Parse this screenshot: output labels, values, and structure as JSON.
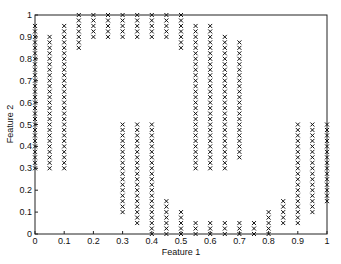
{
  "chart_data": {
    "type": "scatter",
    "title": "",
    "xlabel": "Feature 1",
    "ylabel": "Feature 2",
    "xlim": [
      0,
      1
    ],
    "ylim": [
      0,
      1
    ],
    "grid": false,
    "marker": "x",
    "xticks": [
      "0",
      "0.1",
      "0.2",
      "0.3",
      "0.4",
      "0.5",
      "0.6",
      "0.7",
      "0.8",
      "0.9",
      "1"
    ],
    "yticks": [
      "0",
      "0.1",
      "0.2",
      "0.3",
      "0.4",
      "0.5",
      "0.6",
      "0.7",
      "0.8",
      "0.9",
      "1"
    ],
    "columns": [
      {
        "x": 0.0,
        "ranges": [
          [
            0.3,
            0.95
          ]
        ]
      },
      {
        "x": 0.05,
        "ranges": [
          [
            0.3,
            0.9
          ]
        ]
      },
      {
        "x": 0.1,
        "ranges": [
          [
            0.3,
            0.95
          ]
        ]
      },
      {
        "x": 0.15,
        "ranges": [
          [
            0.85,
            1.0
          ]
        ]
      },
      {
        "x": 0.2,
        "ranges": [
          [
            0.9,
            1.0
          ]
        ]
      },
      {
        "x": 0.25,
        "ranges": [
          [
            0.9,
            1.0
          ]
        ]
      },
      {
        "x": 0.3,
        "ranges": [
          [
            0.1,
            0.5
          ],
          [
            0.9,
            1.0
          ]
        ]
      },
      {
        "x": 0.35,
        "ranges": [
          [
            0.05,
            0.5
          ],
          [
            0.9,
            1.0
          ]
        ]
      },
      {
        "x": 0.4,
        "ranges": [
          [
            0.0,
            0.5
          ],
          [
            0.9,
            1.0
          ]
        ]
      },
      {
        "x": 0.45,
        "ranges": [
          [
            0.0,
            0.15
          ],
          [
            0.9,
            1.0
          ]
        ]
      },
      {
        "x": 0.5,
        "ranges": [
          [
            0.0,
            0.1
          ],
          [
            0.85,
            1.0
          ]
        ]
      },
      {
        "x": 0.55,
        "ranges": [
          [
            0.0,
            0.05
          ],
          [
            0.3,
            0.95
          ]
        ]
      },
      {
        "x": 0.6,
        "ranges": [
          [
            0.0,
            0.05
          ],
          [
            0.3,
            0.95
          ]
        ]
      },
      {
        "x": 0.65,
        "ranges": [
          [
            0.0,
            0.05
          ],
          [
            0.3,
            0.9
          ]
        ]
      },
      {
        "x": 0.7,
        "ranges": [
          [
            0.0,
            0.05
          ],
          [
            0.35,
            0.88
          ]
        ]
      },
      {
        "x": 0.75,
        "ranges": [
          [
            0.0,
            0.05
          ]
        ]
      },
      {
        "x": 0.8,
        "ranges": [
          [
            0.0,
            0.1
          ]
        ]
      },
      {
        "x": 0.85,
        "ranges": [
          [
            0.05,
            0.15
          ]
        ]
      },
      {
        "x": 0.9,
        "ranges": [
          [
            0.05,
            0.5
          ]
        ]
      },
      {
        "x": 0.95,
        "ranges": [
          [
            0.1,
            0.5
          ]
        ]
      },
      {
        "x": 1.0,
        "ranges": [
          [
            0.15,
            0.5
          ]
        ]
      }
    ],
    "step": 0.025
  }
}
